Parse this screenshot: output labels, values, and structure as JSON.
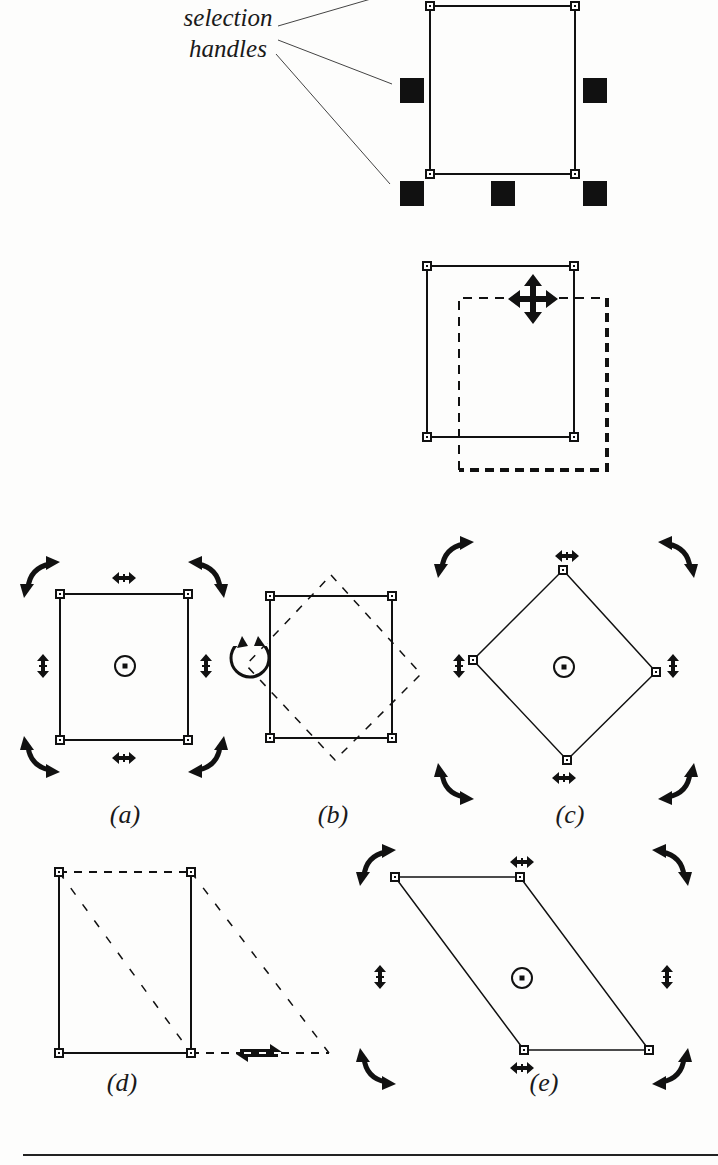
{
  "callout": {
    "line1": "selection",
    "line2": "handles"
  },
  "figures": [
    {
      "id": "selection",
      "description": "rectangle with eight black selection handles"
    },
    {
      "id": "move",
      "description": "rectangle being dragged with four-way move cursor, dashed outline shows new position"
    },
    {
      "id": "a",
      "caption": "(a)",
      "description": "rotate/skew handles around selected rectangle with center of rotation"
    },
    {
      "id": "b",
      "caption": "(b)",
      "description": "rectangle being rotated, dashed rotated outline, rotate cursor"
    },
    {
      "id": "c",
      "caption": "(c)",
      "description": "rotated rectangle (diamond) with rotate/skew handles"
    },
    {
      "id": "d",
      "caption": "(d)",
      "description": "rectangle being skewed horizontally, dashed skewed outline, skew cursor"
    },
    {
      "id": "e",
      "caption": "(e)",
      "description": "skewed parallelogram with rotate/skew handles"
    }
  ],
  "captions": {
    "a": "(a)",
    "b": "(b)",
    "c": "(c)",
    "d": "(d)",
    "e": "(e)"
  },
  "colors": {
    "ink": "#111111",
    "paper": "#fdfdfc"
  }
}
